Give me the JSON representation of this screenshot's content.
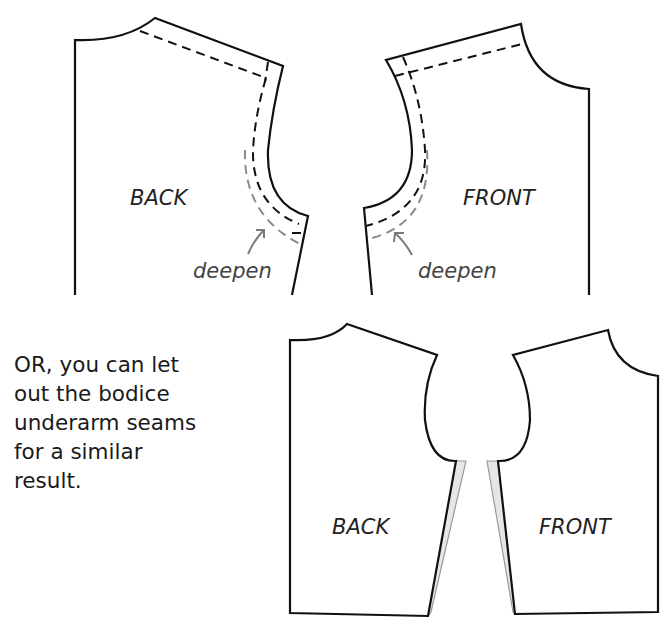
{
  "diagram": {
    "top_row": {
      "back": {
        "label": "BACK",
        "annotation": "deepen"
      },
      "front": {
        "label": "FRONT",
        "annotation": "deepen"
      }
    },
    "bottom_row": {
      "note": "OR, you can let\nout the bodice\nunderarm seams\nfor a similar\nresult.",
      "back": {
        "label": "BACK"
      },
      "front": {
        "label": "FRONT"
      }
    },
    "colors": {
      "outline": "#111111",
      "original_stitch_line": "#111111",
      "new_stitch_line": "#8a8a8a",
      "let_out_area": "#e6e6e6"
    }
  }
}
